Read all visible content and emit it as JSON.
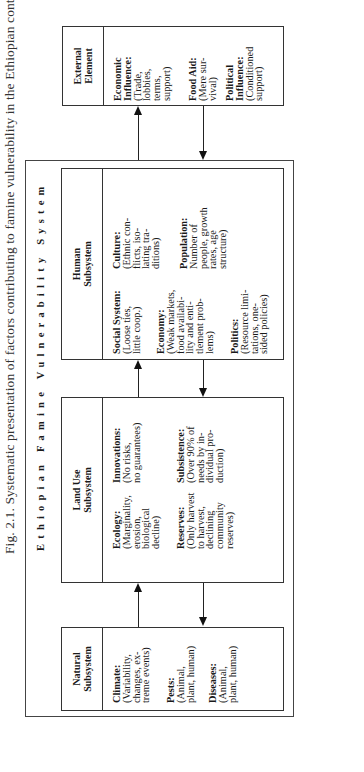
{
  "caption": "Fig. 2.1.  Systematic presentation of factors contributing to famine vulnerability in the Ethiopian context.",
  "system_title": "Ethiopian Famine Vulnerability System",
  "subsystems": {
    "natural": {
      "header": [
        "Natural",
        "Subsystem"
      ],
      "entries": [
        {
          "label": "Climate:",
          "lines": [
            "(Variability,",
            "changes, ex-",
            "treme events)"
          ]
        },
        {
          "label": "Pests:",
          "lines": [
            "(Animal,",
            "plant, human)"
          ]
        },
        {
          "label": "Diseases:",
          "lines": [
            "(Animal,",
            "plant, human)"
          ]
        }
      ]
    },
    "land_use": {
      "header": [
        "Land Use",
        "Subsystem"
      ],
      "entries": [
        {
          "label": "Ecology:",
          "lines": [
            "(Marginality,",
            "erosion,",
            "biological",
            "decline)"
          ]
        },
        {
          "label": "Reserves:",
          "lines": [
            "(Only harvest",
            "to harvest,",
            "declining",
            "community",
            "reserves)"
          ]
        },
        {
          "label": "Innovations:",
          "lines": [
            "(No risks,",
            "no guarantees)"
          ]
        },
        {
          "label": "Subsistence:",
          "lines": [
            "(Over 90% of",
            "needs by in-",
            "dividual pro-",
            "duction)"
          ]
        }
      ]
    },
    "human": {
      "header": [
        "Human",
        "Subsystem"
      ],
      "entries": [
        {
          "label": "Social System:",
          "lines": [
            "(Loose ties,",
            "little coop.)"
          ]
        },
        {
          "label": "Economy:",
          "lines": [
            "(Weak markets,",
            "food availabi-",
            "lity and enti-",
            "tlement prob-",
            "lems)"
          ]
        },
        {
          "label": "Politics:",
          "lines": [
            "(Resource limi-",
            "tations, one-",
            "sided policies)"
          ]
        },
        {
          "label": "Culture:",
          "lines": [
            "(Ethnic con-",
            "flicts, iso-",
            "lating tra-",
            "ditions)"
          ]
        },
        {
          "label": "Population:",
          "lines": [
            "Number of",
            "people, growth",
            "rates, age",
            "structure)"
          ]
        }
      ]
    }
  },
  "external": {
    "header": [
      "External",
      "Element"
    ],
    "entries": [
      {
        "label": "Economic",
        "label2": "Influence:",
        "lines": [
          "(Trade,",
          "lobbies,",
          "terms,",
          "support)"
        ]
      },
      {
        "label": "Food Aid:",
        "lines": [
          "(Mere sur-",
          "vival)"
        ]
      },
      {
        "label": "Political",
        "label2": "Influence:",
        "lines": [
          "(Conditioned",
          "support)"
        ]
      }
    ]
  },
  "colors": {
    "line": "#333333",
    "text": "#1a1a1a",
    "background": "#ffffff"
  }
}
